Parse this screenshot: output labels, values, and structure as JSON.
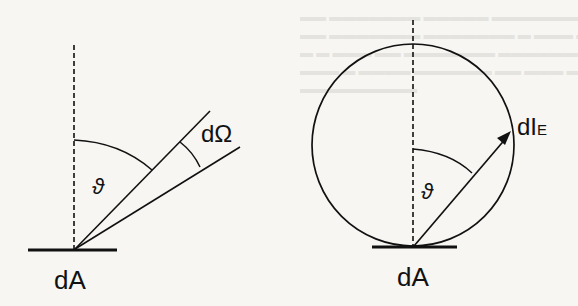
{
  "figure": {
    "left_diagram": {
      "base_label": "dA",
      "angle_label": "ϑ",
      "solid_angle_label": "dΩ"
    },
    "right_diagram": {
      "base_label": "dA",
      "angle_label": "ϑ",
      "vector_label_main": "dI",
      "vector_label_sub": "E"
    }
  },
  "colors": {
    "ink": "#111111",
    "paper": "#f7f6f3",
    "bleed_through": "#e4e2dd"
  }
}
